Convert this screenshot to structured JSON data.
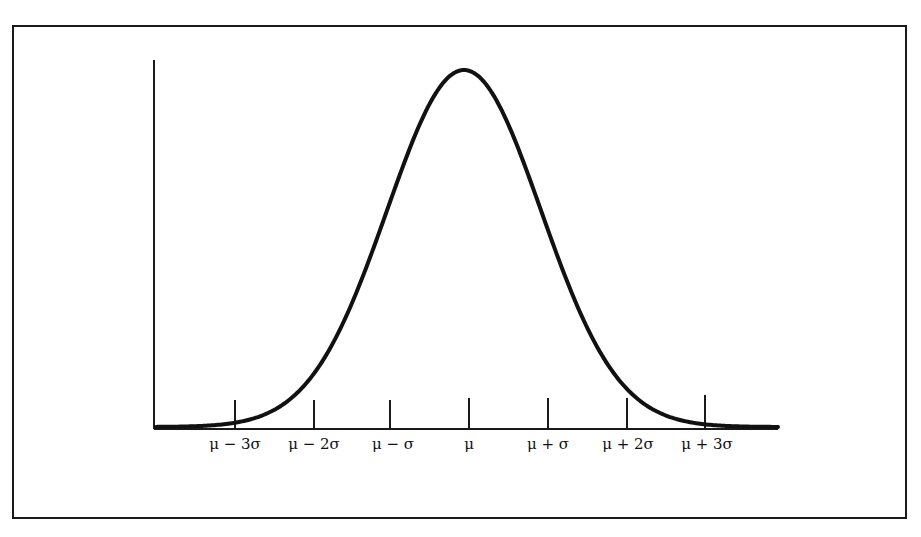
{
  "chart_data": {
    "type": "line",
    "title": "",
    "xlabel": "",
    "ylabel": "",
    "categories": [
      "μ − 3σ",
      "μ − 2σ",
      "μ − σ",
      "μ",
      "μ + σ",
      "μ + 2σ",
      "μ + 3σ"
    ],
    "x": [
      -3,
      -2,
      -1,
      0,
      1,
      2,
      3
    ],
    "series": [
      {
        "name": "normal density",
        "values": [
          0.0044,
          0.054,
          0.242,
          0.399,
          0.242,
          0.054,
          0.0044
        ]
      }
    ],
    "xlim": [
      -4,
      4
    ],
    "ylim": [
      0,
      0.42
    ],
    "grid": false,
    "legend": "none",
    "colors": {
      "line": "#111111",
      "axes": "#1a1a1a",
      "background": "#ffffff"
    }
  },
  "labels": {
    "m3": "μ − 3σ",
    "m2": "μ − 2σ",
    "m1": "μ − σ",
    "mu": "μ",
    "p1": "μ + σ",
    "p2": "μ + 2σ",
    "p3": "μ + 3σ"
  }
}
